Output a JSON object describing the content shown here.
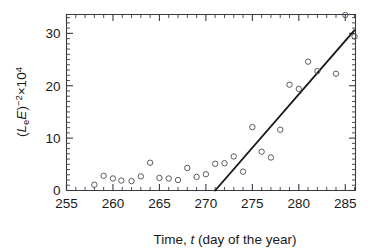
{
  "chart_data": {
    "type": "scatter",
    "title": "",
    "xlabel": "Time, t (day of the year)",
    "ylabel": "(LeE)^-2 x10^4",
    "ylabel_parts": {
      "open_paren": "(",
      "L": "L",
      "L_sub": "e",
      "E": "E",
      "close_paren": ")",
      "exponent": "−2",
      "times": "×10",
      "times_exponent": "4"
    },
    "xlabel_parts": {
      "prefix": "Time, ",
      "variable": "t",
      "suffix": " (day of the year)"
    },
    "xlim": [
      255,
      286.1
    ],
    "ylim": [
      0,
      33.6
    ],
    "xticks": [
      255,
      260,
      265,
      270,
      275,
      280,
      285
    ],
    "xtick_labels": [
      "255",
      "260",
      "265",
      "270",
      "275",
      "280",
      "285"
    ],
    "yticks": [
      0,
      10,
      20,
      30
    ],
    "ytick_labels": [
      "0",
      "10",
      "20",
      "30"
    ],
    "x_minor_step": 1,
    "y_minor_step": 1,
    "grid": false,
    "legend": null,
    "marker_style": "open-circle",
    "series": [
      {
        "name": "observations",
        "points": [
          [
            258.0,
            1.1
          ],
          [
            259.0,
            2.8
          ],
          [
            260.0,
            2.3
          ],
          [
            260.9,
            1.9
          ],
          [
            262.0,
            1.8
          ],
          [
            263.0,
            2.7
          ],
          [
            264.0,
            5.3
          ],
          [
            265.0,
            2.4
          ],
          [
            266.0,
            2.3
          ],
          [
            267.0,
            2.0
          ],
          [
            268.0,
            4.3
          ],
          [
            269.0,
            2.6
          ],
          [
            270.0,
            3.1
          ],
          [
            271.0,
            5.1
          ],
          [
            272.0,
            5.2
          ],
          [
            273.0,
            6.5
          ],
          [
            274.0,
            3.6
          ],
          [
            275.0,
            12.1
          ],
          [
            276.0,
            7.4
          ],
          [
            277.0,
            6.3
          ],
          [
            278.0,
            11.6
          ],
          [
            279.0,
            20.2
          ],
          [
            280.0,
            19.4
          ],
          [
            281.0,
            24.6
          ],
          [
            282.0,
            22.8
          ],
          [
            284.0,
            22.3
          ],
          [
            285.0,
            33.5
          ],
          [
            286.0,
            29.4
          ]
        ]
      }
    ],
    "fit_line": {
      "name": "linear fit",
      "x_start": 271.0,
      "y_start": 0.0,
      "x_end": 286.0,
      "y_end": 30.6
    }
  }
}
